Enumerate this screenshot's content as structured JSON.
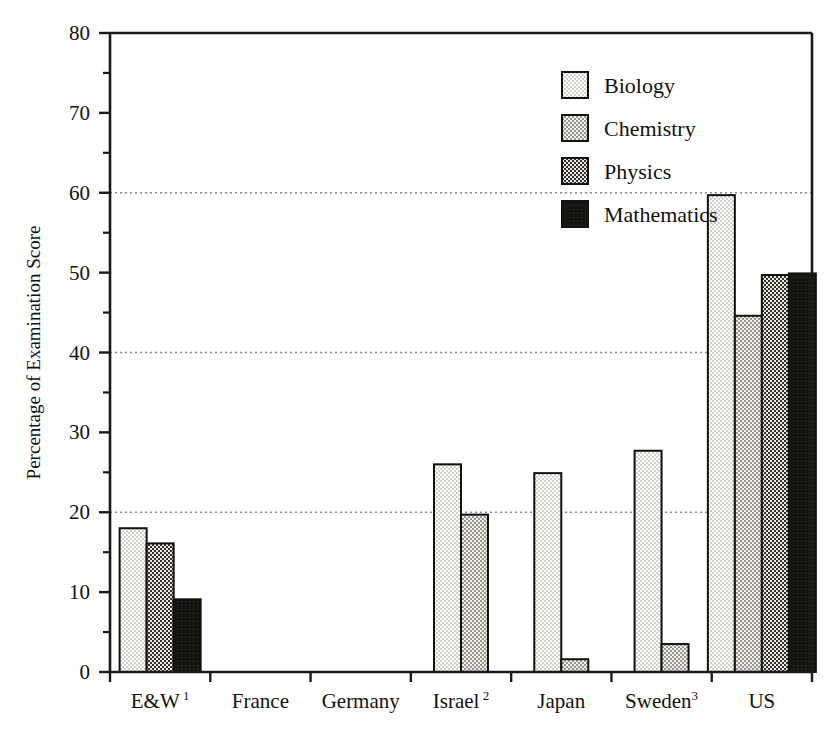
{
  "chart_data": {
    "type": "bar",
    "title": "",
    "xlabel": "",
    "ylabel": "Percentage of Examination Score",
    "ylim": [
      0,
      80
    ],
    "ytick_labels": [
      "0",
      "10",
      "20",
      "30",
      "40",
      "50",
      "60",
      "70",
      "80"
    ],
    "ytick_values": [
      0,
      10,
      20,
      30,
      40,
      50,
      60,
      70,
      80
    ],
    "yminor_values": [
      5,
      15,
      25,
      35,
      45,
      55,
      65,
      75
    ],
    "gridline_values": [
      20,
      40,
      60
    ],
    "grid": "horizontal-dotted-at-20-40-60",
    "legend_position": "top-right-inside",
    "categories": [
      "E&W",
      "France",
      "Germany",
      "Israel",
      "Japan",
      "Sweden",
      "US"
    ],
    "category_superscripts": [
      "1",
      "",
      "",
      "2",
      "",
      "3",
      ""
    ],
    "series": [
      {
        "name": "Biology",
        "fill": "pattern-biology",
        "color": "#e9e6dd",
        "values": [
          18.0,
          null,
          null,
          26.0,
          24.9,
          27.7,
          59.7
        ]
      },
      {
        "name": "Chemistry",
        "fill": "pattern-chemistry",
        "color": "#c9c6bd",
        "values": [
          null,
          null,
          null,
          19.7,
          1.6,
          3.5,
          44.6
        ]
      },
      {
        "name": "Physics",
        "fill": "pattern-physics",
        "color": "#8a8780",
        "values": [
          16.1,
          null,
          null,
          null,
          null,
          null,
          49.7
        ]
      },
      {
        "name": "Mathematics",
        "fill": "pattern-mathematics",
        "color": "#17150f",
        "values": [
          9.1,
          null,
          null,
          null,
          null,
          null,
          49.9
        ]
      }
    ]
  },
  "legend": {
    "items": [
      {
        "label": "Biology"
      },
      {
        "label": "Chemistry"
      },
      {
        "label": "Physics"
      },
      {
        "label": "Mathematics"
      }
    ]
  },
  "axes": {
    "y_title": "Percentage of Examination Score"
  }
}
